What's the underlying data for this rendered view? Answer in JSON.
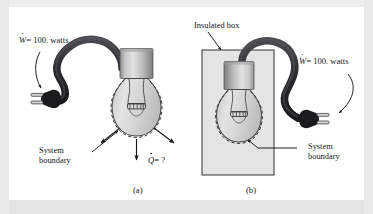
{
  "figure": {
    "panels": [
      {
        "id": "a",
        "caption": "(a)",
        "labels": {
          "work_symbol": "W",
          "work_text": "= 100. watts",
          "work_full": "W = 100. watts",
          "heat_symbol": "Q",
          "heat_text": "= ?",
          "heat_full": "Q = ?",
          "system_boundary_line1": "System",
          "system_boundary_line2": "boundary"
        }
      },
      {
        "id": "b",
        "caption": "(b)",
        "labels": {
          "insulated_box": "Insulated box",
          "work_symbol": "W",
          "work_text": "= 100. watts",
          "work_full": "W = 100. watts",
          "system_boundary_line1": "System",
          "system_boundary_line2": "boundary"
        }
      }
    ],
    "colors": {
      "background": "#efefef",
      "plate": "#ffffff",
      "cord": "#2f2f33",
      "plug": "#1d1d20",
      "socket_light": "#d8d8d8",
      "socket_dark": "#8d8d8d",
      "glass": "#d9d9d9",
      "outline": "#3a3a3c",
      "box_fill": "#e3e3e3",
      "text": "#16161a"
    }
  }
}
